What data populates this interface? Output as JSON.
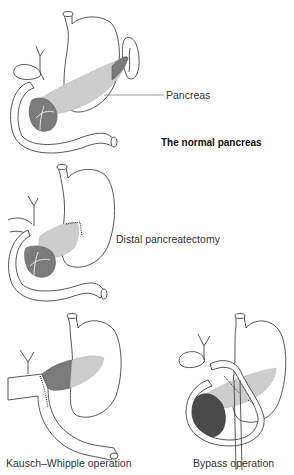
{
  "figure": {
    "panels": [
      {
        "id": "normal",
        "label": "Pancreas",
        "title": "The normal pancreas"
      },
      {
        "id": "distal",
        "label": "Distal pancreatectomy"
      },
      {
        "id": "whipple",
        "label": "Kausch–Whipple operation"
      },
      {
        "id": "bypass",
        "label": "Bypass operation"
      }
    ],
    "colors": {
      "pancreas_body": "#cdcdcd",
      "pancreas_head": "#7b7b7b",
      "tumor": "#4a4a4a",
      "outline": "#444444"
    }
  }
}
